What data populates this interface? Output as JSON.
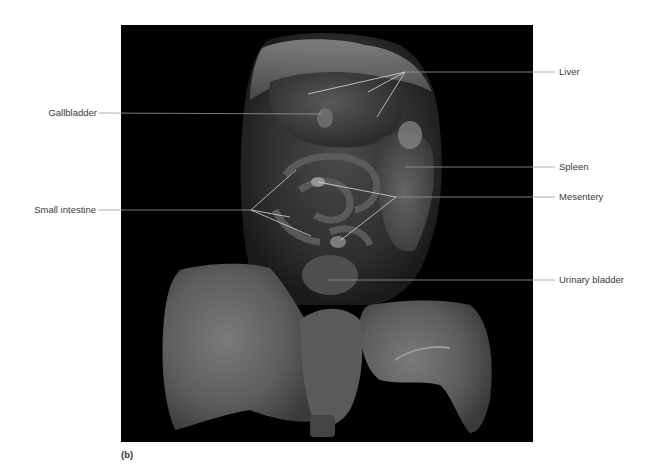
{
  "figure": {
    "panel_label": "(b)",
    "labels_left": [
      {
        "id": "gallbladder",
        "text": "Gallbladder"
      },
      {
        "id": "small-intestine",
        "text": "Small intestine"
      }
    ],
    "labels_right": [
      {
        "id": "liver",
        "text": "Liver"
      },
      {
        "id": "spleen",
        "text": "Spleen"
      },
      {
        "id": "mesentery",
        "text": "Mesentery"
      },
      {
        "id": "urinary-bladder",
        "text": "Urinary bladder"
      }
    ],
    "colors": {
      "photo_background": "#000000",
      "leader_line": "#9a9a9a",
      "leader_line_inside": "#d8d8d8",
      "label_text": "#3a3a3a"
    }
  }
}
